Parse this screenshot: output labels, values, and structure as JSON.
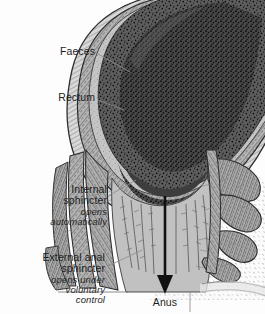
{
  "figure": {
    "width": 265,
    "height": 314,
    "background_color": "#fdfdfd",
    "ink_color": "#1d1d1d"
  },
  "labels": {
    "faeces": {
      "text": "Faeces"
    },
    "rectum": {
      "text": "Rectum"
    },
    "internal_sphincter": {
      "line1": "Internal",
      "line2": "sphincter",
      "note1": "opens",
      "note2": "automatically"
    },
    "external_sphincter": {
      "line1": "External anal",
      "line2": "sphincter",
      "note1": "opens under",
      "note2": "voluntary",
      "note3": "control"
    },
    "anus": {
      "text": "Anus"
    }
  },
  "structures": {
    "faeces_mass_color": "#5a5a5a",
    "rectal_wall_color": "#c9c9c9",
    "anal_canal_color": "#bdbdbd",
    "muscle_bundle_color": "#a8a8a8",
    "outline_color": "#2a2a2a",
    "leader_line_color": "#8a8a8a",
    "arrow_color": "#111111"
  },
  "annotations": {
    "direction_arrow": "downward arrow through anal canal to anus"
  }
}
